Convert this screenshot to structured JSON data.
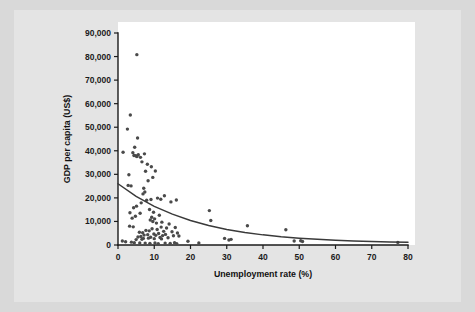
{
  "chart_data": {
    "type": "scatter",
    "title": "",
    "xlabel": "Unemployment rate (%)",
    "ylabel": "GDP per capita (US$)",
    "xlim": [
      0,
      80
    ],
    "ylim": [
      0,
      90000
    ],
    "xticks": [
      0,
      10,
      20,
      30,
      40,
      50,
      60,
      70,
      80
    ],
    "xtick_labels": [
      "0",
      "10",
      "20",
      "30",
      "40",
      "50",
      "60",
      "70",
      "80"
    ],
    "yticks": [
      0,
      10000,
      20000,
      30000,
      40000,
      50000,
      60000,
      70000,
      80000,
      90000
    ],
    "ytick_labels": [
      "0",
      "10,000",
      "20,000",
      "30,000",
      "40,000",
      "50,000",
      "60,000",
      "70,000",
      "80,000",
      "90,000"
    ],
    "grid": false,
    "legend": "none",
    "marker_color": "#4a4a4a",
    "trend_color": "#3a3a3a",
    "plot_background": "#ffffff",
    "figure_background": "#e4e4e4",
    "points": [
      [
        5.2,
        80800
      ],
      [
        3.4,
        55200
      ],
      [
        2.6,
        49200
      ],
      [
        1.4,
        39400
      ],
      [
        5.4,
        45400
      ],
      [
        4.6,
        41500
      ],
      [
        4.1,
        39200
      ],
      [
        4.4,
        38000
      ],
      [
        4.9,
        37900
      ],
      [
        5.2,
        37600
      ],
      [
        5.6,
        38300
      ],
      [
        6.2,
        37200
      ],
      [
        7.3,
        38700
      ],
      [
        6.6,
        35300
      ],
      [
        8.1,
        34300
      ],
      [
        9.2,
        33200
      ],
      [
        7.6,
        31300
      ],
      [
        10.3,
        31400
      ],
      [
        3.0,
        29800
      ],
      [
        9.6,
        28700
      ],
      [
        8.3,
        27300
      ],
      [
        2.8,
        25300
      ],
      [
        3.6,
        25100
      ],
      [
        7.1,
        24100
      ],
      [
        7.4,
        22500
      ],
      [
        6.9,
        21700
      ],
      [
        12.8,
        20900
      ],
      [
        10.9,
        19900
      ],
      [
        11.8,
        19400
      ],
      [
        16.1,
        19100
      ],
      [
        14.6,
        18300
      ],
      [
        9.1,
        19300
      ],
      [
        7.9,
        19000
      ],
      [
        6.4,
        17900
      ],
      [
        5.1,
        16500
      ],
      [
        4.3,
        15800
      ],
      [
        8.7,
        15100
      ],
      [
        25.2,
        14600
      ],
      [
        3.3,
        13700
      ],
      [
        6.1,
        13500
      ],
      [
        9.8,
        13900
      ],
      [
        11.4,
        12600
      ],
      [
        4.8,
        12200
      ],
      [
        3.9,
        11400
      ],
      [
        9.3,
        11800
      ],
      [
        10.1,
        11100
      ],
      [
        8.9,
        10600
      ],
      [
        25.6,
        10400
      ],
      [
        9.6,
        10000
      ],
      [
        12.1,
        9700
      ],
      [
        10.6,
        9300
      ],
      [
        14.1,
        8900
      ],
      [
        35.7,
        8200
      ],
      [
        3.2,
        8000
      ],
      [
        4.2,
        7700
      ],
      [
        11.9,
        7600
      ],
      [
        13.4,
        7200
      ],
      [
        15.8,
        7400
      ],
      [
        9.4,
        6900
      ],
      [
        10.8,
        6600
      ],
      [
        46.3,
        6500
      ],
      [
        7.7,
        6200
      ],
      [
        8.6,
        6000
      ],
      [
        12.6,
        5800
      ],
      [
        14.9,
        5600
      ],
      [
        5.9,
        5400
      ],
      [
        6.8,
        5200
      ],
      [
        16.4,
        5100
      ],
      [
        11.2,
        4900
      ],
      [
        9.9,
        4700
      ],
      [
        13.1,
        4500
      ],
      [
        8.2,
        4400
      ],
      [
        7.2,
        4200
      ],
      [
        10.4,
        4100
      ],
      [
        12.3,
        4000
      ],
      [
        15.3,
        3900
      ],
      [
        16.8,
        3800
      ],
      [
        6.3,
        3600
      ],
      [
        5.5,
        3400
      ],
      [
        9.0,
        3300
      ],
      [
        11.6,
        3200
      ],
      [
        13.8,
        3100
      ],
      [
        8.4,
        2900
      ],
      [
        7.0,
        2800
      ],
      [
        10.0,
        2700
      ],
      [
        12.0,
        2600
      ],
      [
        6.6,
        2400
      ],
      [
        5.0,
        2300
      ],
      [
        29.4,
        2800
      ],
      [
        31.2,
        2400
      ],
      [
        30.6,
        2100
      ],
      [
        48.6,
        1700
      ],
      [
        50.4,
        1800
      ],
      [
        50.9,
        1500
      ],
      [
        19.3,
        1600
      ],
      [
        22.3,
        900
      ],
      [
        1.2,
        1700
      ],
      [
        2.1,
        1400
      ],
      [
        3.7,
        1200
      ],
      [
        4.5,
        1000
      ],
      [
        6.0,
        900
      ],
      [
        7.5,
        800
      ],
      [
        8.8,
        700
      ],
      [
        10.2,
        900
      ],
      [
        11.1,
        600
      ],
      [
        13.0,
        800
      ],
      [
        14.4,
        700
      ],
      [
        15.6,
        1000
      ],
      [
        16.2,
        600
      ],
      [
        77.2,
        1100
      ]
    ],
    "trend": {
      "description": "exponential decay fit",
      "y_at_x0": 26000,
      "points": [
        [
          0,
          26000
        ],
        [
          5,
          20600
        ],
        [
          10,
          16400
        ],
        [
          15,
          13100
        ],
        [
          20,
          10400
        ],
        [
          25,
          8300
        ],
        [
          30,
          6600
        ],
        [
          35,
          5300
        ],
        [
          40,
          4300
        ],
        [
          45,
          3500
        ],
        [
          50,
          2900
        ],
        [
          55,
          2400
        ],
        [
          60,
          2000
        ],
        [
          65,
          1700
        ],
        [
          70,
          1500
        ],
        [
          75,
          1300
        ],
        [
          80,
          1200
        ]
      ]
    }
  }
}
